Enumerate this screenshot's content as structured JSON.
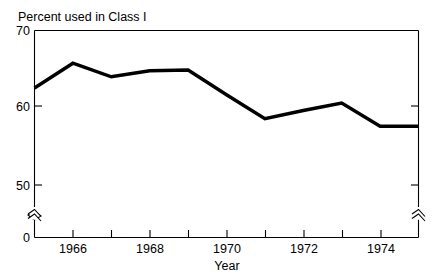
{
  "chart_data": {
    "type": "line",
    "title": "Percent used in Class I",
    "xlabel": "Year",
    "ylabel": "",
    "x": [
      1965,
      1966,
      1967,
      1968,
      1969,
      1970,
      1971,
      1972,
      1973,
      1974,
      1975
    ],
    "values": [
      62.4,
      65.7,
      63.9,
      64.7,
      64.8,
      61.5,
      58.3,
      59.4,
      60.4,
      57.3,
      57.3
    ],
    "series": [
      {
        "name": "Percent used in Class I",
        "values": [
          62.4,
          65.7,
          63.9,
          64.7,
          64.8,
          61.5,
          58.3,
          59.4,
          60.4,
          57.3,
          57.3
        ]
      }
    ],
    "ylim": [
      50,
      70
    ],
    "xlim": [
      1965,
      1975
    ],
    "y_tick_labels": [
      "70",
      "60",
      "50",
      "0"
    ],
    "y_tick_values": [
      70,
      60,
      50,
      0
    ],
    "x_tick_labels": [
      "1966",
      "1968",
      "1970",
      "1972",
      "1974"
    ],
    "x_tick_values": [
      1966,
      1968,
      1970,
      1972,
      1974
    ],
    "x_minor_tick_values": [
      1967,
      1969,
      1971,
      1973,
      1975
    ],
    "axis_break": true,
    "axis_break_between": [
      0,
      50
    ],
    "grid": false,
    "legend": "none",
    "line_color": "#000000",
    "background_color": "#ffffff"
  },
  "labels": {
    "title": "Percent used in Class I",
    "xaxis_title": "Year",
    "y_70": "70",
    "y_60": "60",
    "y_50": "50",
    "y_0": "0",
    "x_1966": "1966",
    "x_1968": "1968",
    "x_1970": "1970",
    "x_1972": "1972",
    "x_1974": "1974"
  }
}
